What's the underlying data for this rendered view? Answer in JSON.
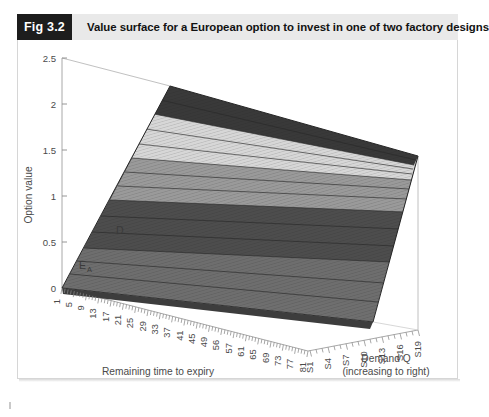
{
  "figure": {
    "badge": "Fig 3.2",
    "caption": "Value surface for a European option to invest in one of two factory designs"
  },
  "chart_data": {
    "type": "surface",
    "title": "Value surface for a European option to invest in one of two factory designs",
    "zlabel": "Option value",
    "zticks": [
      "0",
      "0.5",
      "1",
      "1.5",
      "2",
      "2.5"
    ],
    "zlim": [
      0,
      2.5
    ],
    "xlabel": "Remaining time to expiry",
    "xlabel_sub": "(expiry at left)",
    "xticks": [
      "1",
      "5",
      "9",
      "13",
      "17",
      "21",
      "25",
      "29",
      "33",
      "37",
      "41",
      "45",
      "49",
      "56",
      "57",
      "61",
      "65",
      "69",
      "73",
      "77",
      "81"
    ],
    "ylabel": "Demand Q",
    "ylabel_sub": "(increasing to right)",
    "yticks": [
      "S1",
      "S4",
      "S7",
      "S10",
      "S13",
      "S16",
      "S19"
    ],
    "annotations": [
      {
        "text": "D",
        "sub": ""
      },
      {
        "text": "E",
        "sub": "A"
      }
    ],
    "legend": "none",
    "grid": false,
    "bands": [
      {
        "range": "2.0-2.5",
        "color": "#3a3a3a"
      },
      {
        "range": "1.5-2.0",
        "color": "#d8d8d8"
      },
      {
        "range": "1.0-1.5",
        "color": "#9a9a9a"
      },
      {
        "range": "0.5-1.0",
        "color": "#4e4e4e"
      },
      {
        "range": "0.0-0.5",
        "color": "#6f6f6f"
      }
    ],
    "surface_description": "Option value rises monotonically with remaining time to expiry and with demand Q; near zero at the front-left (expiry, low demand) corner and reaching about 2.5 at the far corner."
  }
}
